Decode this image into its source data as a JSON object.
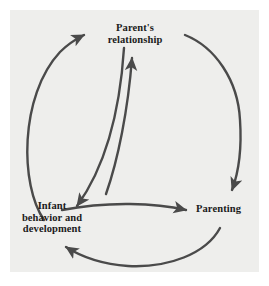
{
  "figure": {
    "type": "cyclical-transactional-model",
    "background_color": "#eeeeec",
    "page_color": "#ffffff",
    "stroke_color": "#4a4a4a",
    "text_color": "#1b1b1b"
  },
  "nodes": [
    {
      "id": "parents-relationship",
      "label": "Parent's\nrelationship",
      "position": "top"
    },
    {
      "id": "parenting",
      "label": "Parenting",
      "position": "bottom-right"
    },
    {
      "id": "infant",
      "label": "Infant\nbehavior and\ndevelopment",
      "position": "bottom-left"
    }
  ],
  "connections": [
    {
      "id": "outer-infant-to-parents",
      "from": "infant",
      "to": "parents-relationship",
      "style": "outer-arc",
      "arrowhead": "at-target"
    },
    {
      "id": "outer-parents-to-parenting",
      "from": "parents-relationship",
      "to": "parenting",
      "style": "outer-arc",
      "arrowhead": "at-target"
    },
    {
      "id": "outer-parenting-to-infant",
      "from": "parenting",
      "to": "infant",
      "style": "outer-arc",
      "arrowhead": "at-target"
    },
    {
      "id": "inner-infant-to-parents",
      "from": "infant",
      "to": "parents-relationship",
      "style": "inner-curve",
      "arrowhead": "at-target"
    },
    {
      "id": "inner-parents-to-infant",
      "from": "parents-relationship",
      "to": "infant",
      "style": "inner-curve",
      "arrowhead": "at-target"
    },
    {
      "id": "inner-infant-to-parenting",
      "from": "infant",
      "to": "parenting",
      "style": "inner-curve",
      "arrowhead": "at-target"
    }
  ]
}
